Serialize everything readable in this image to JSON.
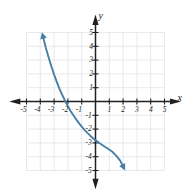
{
  "figure": {
    "type": "graph",
    "background_color": "#ffffff"
  },
  "axes": {
    "x_axis_label": "x",
    "y_axis_label": "y",
    "axis_color": "#231f20",
    "grid_color": "#dfe3ea",
    "x_tick_labels": [
      "-5",
      "-4",
      "-3",
      "-2",
      "-1",
      "1",
      "2",
      "3",
      "4",
      "5"
    ],
    "y_tick_labels": [
      "5",
      "4",
      "3",
      "2",
      "1",
      "-1",
      "-2",
      "-3",
      "-4",
      "-5"
    ]
  },
  "chart_data": {
    "type": "line",
    "title": "",
    "xlabel": "x",
    "ylabel": "y",
    "xlim": [
      -5.5,
      5.5
    ],
    "ylim": [
      -5.5,
      5.5
    ],
    "grid": true,
    "legend": "none",
    "series": [
      {
        "name": "curve",
        "color": "#4a7fa5",
        "arrow_start": true,
        "arrow_end": true,
        "x": [
          -3.8,
          -3.6,
          -3.4,
          -3.2,
          -3.0,
          -2.8,
          -2.6,
          -2.4,
          -2.2,
          -2.0,
          -1.8,
          -1.6,
          -1.4,
          -1.2,
          -1.0,
          -0.8,
          -0.6,
          -0.4,
          -0.2,
          0.0,
          0.3,
          0.6,
          0.9,
          1.2,
          1.5,
          1.8,
          2.0
        ],
        "y": [
          4.7,
          3.9,
          3.2,
          2.55,
          1.95,
          1.4,
          0.9,
          0.45,
          0.05,
          -0.35,
          -0.7,
          -1.0,
          -1.3,
          -1.57,
          -1.82,
          -2.05,
          -2.26,
          -2.46,
          -2.64,
          -2.8,
          -3.02,
          -3.22,
          -3.42,
          -3.62,
          -3.92,
          -4.3,
          -4.7
        ]
      }
    ],
    "x_ticks": [
      -5,
      -4,
      -3,
      -2,
      -1,
      1,
      2,
      3,
      4,
      5
    ],
    "y_ticks": [
      5,
      4,
      3,
      2,
      1,
      -1,
      -2,
      -3,
      -4,
      -5
    ],
    "x_intercept": -2.15,
    "y_intercept": -2.8
  }
}
